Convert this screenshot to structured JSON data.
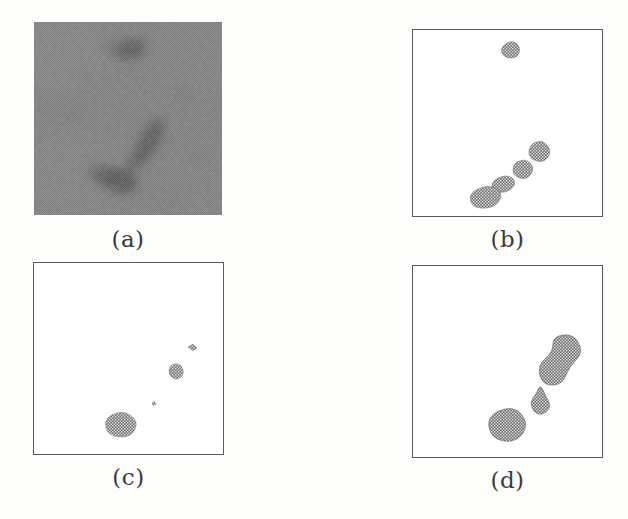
{
  "figure": {
    "width": 628,
    "height": 519,
    "background_color": "#ffffff",
    "caption_font_color": "#3a3a3a",
    "panel_border_color": "#5a5a5a",
    "blob_fill_color": "#6e6e6e",
    "texture_gray": "#808080"
  },
  "panels": [
    {
      "id": "a",
      "caption": "(a)",
      "kind": "grayscale-texture-image",
      "x": 34,
      "y": 22,
      "width": 188,
      "height": 193,
      "caption_x": 34,
      "caption_y": 228,
      "caption_width": 188,
      "has_border": false,
      "description": "noisy dithered gray micro-image with dark streak regions",
      "regions": [
        {
          "name": "upper-spot",
          "cx": 130,
          "cy": 49,
          "rx": 13,
          "ry": 8,
          "rot": -20,
          "darkness": 0.45
        },
        {
          "name": "mid-streak",
          "cx": 150,
          "cy": 140,
          "rx": 11,
          "ry": 24,
          "rot": 35,
          "darkness": 0.4
        },
        {
          "name": "lower-blob",
          "cx": 116,
          "cy": 180,
          "rx": 19,
          "ry": 12,
          "rot": 20,
          "darkness": 0.45
        },
        {
          "name": "link-streak",
          "cx": 133,
          "cy": 161,
          "rx": 9,
          "ry": 16,
          "rot": 40,
          "darkness": 0.3
        }
      ]
    },
    {
      "id": "b",
      "caption": "(b)",
      "kind": "binary-segmentation",
      "x": 412,
      "y": 29,
      "width": 191,
      "height": 188,
      "caption_x": 412,
      "caption_y": 228,
      "caption_width": 191,
      "has_border": true,
      "blobs": [
        {
          "name": "isolated-top",
          "cx": 512,
          "cy": 49,
          "rx": 7.5,
          "ry": 6,
          "rot": -15
        },
        {
          "name": "chain-upper",
          "cx": 538,
          "cy": 150,
          "rx": 9,
          "ry": 8,
          "rot": -30
        },
        {
          "name": "chain-mid",
          "cx": 522,
          "cy": 169,
          "rx": 8.5,
          "ry": 7.5,
          "rot": -10
        },
        {
          "name": "chain-lower",
          "cx": 505,
          "cy": 184,
          "rx": 9,
          "ry": 6,
          "rot": -25
        },
        {
          "name": "chain-bottom",
          "cx": 487,
          "cy": 196,
          "rx": 12,
          "ry": 8,
          "rot": -20
        }
      ]
    },
    {
      "id": "c",
      "caption": "(c)",
      "kind": "binary-segmentation",
      "x": 33,
      "y": 262,
      "width": 191,
      "height": 193,
      "caption_x": 33,
      "caption_y": 470,
      "caption_width": 191,
      "has_border": true,
      "blobs": [
        {
          "name": "tiny-top-right",
          "cx": 190,
          "cy": 349,
          "rx": 3.5,
          "ry": 3,
          "rot": 0
        },
        {
          "name": "small-mid",
          "cx": 176,
          "cy": 371,
          "rx": 6,
          "ry": 7,
          "rot": 10
        },
        {
          "name": "speck",
          "cx": 152,
          "cy": 404,
          "rx": 1.8,
          "ry": 2,
          "rot": 0
        },
        {
          "name": "large-lower",
          "cx": 120,
          "cy": 426,
          "rx": 12,
          "ry": 9.5,
          "rot": -15
        }
      ]
    },
    {
      "id": "d",
      "caption": "(d)",
      "kind": "binary-segmentation",
      "x": 412,
      "y": 265,
      "width": 191,
      "height": 193,
      "caption_x": 412,
      "caption_y": 470,
      "caption_width": 191,
      "has_border": true,
      "blobs": [
        {
          "name": "large-upper-a",
          "cx": 557,
          "cy": 347,
          "rx": 14,
          "ry": 16,
          "rot": 15
        },
        {
          "name": "large-upper-b",
          "cx": 546,
          "cy": 371,
          "rx": 13,
          "ry": 14,
          "rot": 15
        },
        {
          "name": "middle-small",
          "cx": 530,
          "cy": 400,
          "rx": 8,
          "ry": 12,
          "rot": 20
        },
        {
          "name": "bottom-round",
          "cx": 510,
          "cy": 424,
          "rx": 14,
          "ry": 15,
          "rot": -10
        }
      ]
    }
  ]
}
